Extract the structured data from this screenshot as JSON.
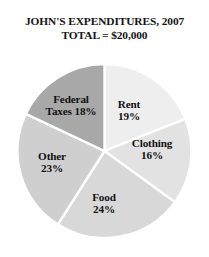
{
  "chart": {
    "title_main": "JOHN'S EXPENDITURES, 2007",
    "title_sub": "TOTAL = $20,000"
  },
  "chart_data": {
    "type": "pie",
    "title": "JOHN'S EXPENDITURES, 2007",
    "subtitle": "TOTAL = $20,000",
    "total_label": "TOTAL = $20,000",
    "total_value": 20000,
    "total_currency": "$",
    "units": "percent",
    "start_angle_deg": 0,
    "direction": "clockwise",
    "legend": "none",
    "labels_inside_slices": true,
    "categories": [
      "Rent",
      "Clothing",
      "Food",
      "Other",
      "Federal Taxes"
    ],
    "values": [
      19,
      16,
      24,
      23,
      18
    ],
    "value_labels": [
      "19%",
      "16%",
      "24%",
      "23%",
      "18%"
    ],
    "amounts": [
      3800,
      3200,
      4800,
      4600,
      3600
    ],
    "colors": [
      "#eeeeee",
      "#e2e2e2",
      "#d8d8d8",
      "#cfcfcf",
      "#a8a8a8"
    ],
    "slices": [
      {
        "name": "Rent",
        "label_line1": "Rent",
        "label_line2": "19%",
        "value": 19,
        "color": "#eeeeee",
        "label_x": 129,
        "label_y": 62
      },
      {
        "name": "Clothing",
        "label_line1": "Clothing",
        "label_line2": "16%",
        "value": 16,
        "color": "#e2e2e2",
        "label_x": 152,
        "label_y": 101
      },
      {
        "name": "Food",
        "label_line1": "Food",
        "label_line2": "24%",
        "value": 24,
        "color": "#d8d8d8",
        "label_x": 104,
        "label_y": 155
      },
      {
        "name": "Other",
        "label_line1": "Other",
        "label_line2": "23%",
        "value": 23,
        "color": "#cfcfcf",
        "label_x": 52,
        "label_y": 114
      },
      {
        "name": "Federal Taxes",
        "label_line1": "Federal",
        "label_line2": "Taxes 18%",
        "value": 18,
        "color": "#a8a8a8",
        "label_x": 71,
        "label_y": 57
      }
    ]
  }
}
